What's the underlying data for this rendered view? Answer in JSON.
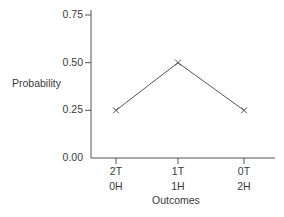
{
  "chart_data": {
    "type": "line",
    "title": "",
    "xlabel": "Outcomes",
    "ylabel": "Probability",
    "categories": [
      "2T 0H",
      "1T 1H",
      "0T 2H"
    ],
    "category_lines": [
      [
        "2T",
        "0H"
      ],
      [
        "1T",
        "1H"
      ],
      [
        "0T",
        "2H"
      ]
    ],
    "series": [
      {
        "name": "Probability",
        "values": [
          0.25,
          0.5,
          0.25
        ],
        "marker": "x"
      }
    ],
    "yticks": [
      "0.00",
      "0.25",
      "0.50",
      "0.75"
    ],
    "ylim": [
      0,
      0.75
    ],
    "grid": false,
    "legend": null
  },
  "colors": {
    "axis": "#555555",
    "line": "#555555",
    "text": "#3a3a3a"
  }
}
